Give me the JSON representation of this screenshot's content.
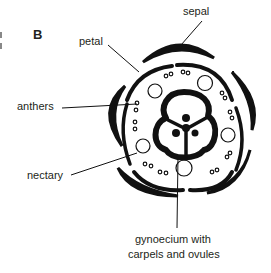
{
  "panel_label": "B",
  "labels": {
    "sepal": "sepal",
    "petal": "petal",
    "anthers": "anthers",
    "nectary": "nectary",
    "gynoecium_line1": "gynoecium with",
    "gynoecium_line2": "carpels and ovules"
  },
  "colors": {
    "ink": "#111111",
    "text": "#231f20",
    "background": "#ffffff"
  }
}
